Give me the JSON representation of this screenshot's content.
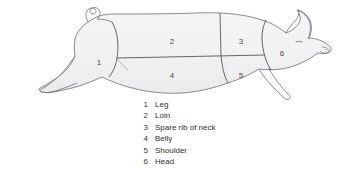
{
  "diagram": {
    "style": {
      "background": "#ffffff",
      "body_fill": "#f4f4f5",
      "body_fill_shade": "#e8e8ea",
      "outline_color": "#6b6b70",
      "divider_color": "#55555a",
      "stripe_color": "#e2e2e5",
      "text_color": "#2e2e2e",
      "number_color": "#4a4a4a"
    },
    "cut_numbers": [
      {
        "id": "1",
        "label": "1",
        "x": 99,
        "y": 63
      },
      {
        "id": "2",
        "label": "2",
        "x": 172,
        "y": 42
      },
      {
        "id": "3",
        "label": "3",
        "x": 241,
        "y": 42
      },
      {
        "id": "4",
        "label": "4",
        "x": 172,
        "y": 76
      },
      {
        "id": "5",
        "label": "5",
        "x": 241,
        "y": 76
      },
      {
        "id": "6",
        "label": "6",
        "x": 282,
        "y": 54
      }
    ]
  },
  "legend": {
    "items": [
      {
        "number": "1",
        "label": "Leg"
      },
      {
        "number": "2",
        "label": "Loin"
      },
      {
        "number": "3",
        "label": "Spare rib of neck"
      },
      {
        "number": "4",
        "label": "Belly"
      },
      {
        "number": "5",
        "label": "Shoulder"
      },
      {
        "number": "6",
        "label": "Head"
      }
    ]
  }
}
